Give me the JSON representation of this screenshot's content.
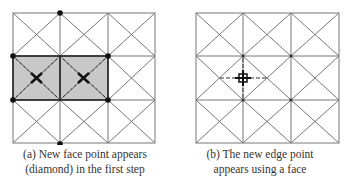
{
  "figures": [
    {
      "id": "a",
      "caption_line1": "(a) New face point appears",
      "caption_line2": "(diamond) in the first step",
      "grid": {
        "cols": 3,
        "rows": 3,
        "diagonals": true
      },
      "shaded_faces": [
        [
          0,
          1
        ],
        [
          1,
          1
        ]
      ],
      "shade_color": "#c8c8c8",
      "vertex_points": 7,
      "face_points": 2
    },
    {
      "id": "b",
      "caption_line1": "(b) The new edge point",
      "caption_line2": "appears using a face",
      "grid": {
        "cols": 3,
        "rows": 3,
        "diagonals": true
      },
      "edge_points": 1
    }
  ]
}
